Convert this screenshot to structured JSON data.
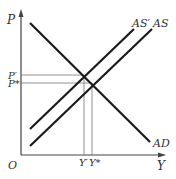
{
  "diagram": {
    "type": "AS-AD model",
    "axes": {
      "y_label": "P",
      "x_label": "Y",
      "origin_label": "O"
    },
    "curves": [
      {
        "id": "AD",
        "label": "AD",
        "slope": "downward"
      },
      {
        "id": "AS_prime",
        "label": "AS′",
        "slope": "upward"
      },
      {
        "id": "AS",
        "label": "AS",
        "slope": "upward"
      }
    ],
    "equilibria": [
      {
        "price_label": "P′",
        "output_label": "Y′",
        "curves": [
          "AD",
          "AS_prime"
        ]
      },
      {
        "price_label": "P*",
        "output_label": "Y*",
        "curves": [
          "AD",
          "AS"
        ]
      }
    ],
    "colors": {
      "curve": "#1a1a1a",
      "axis": "#444444",
      "guide": "#777777",
      "text": "#333333"
    }
  }
}
